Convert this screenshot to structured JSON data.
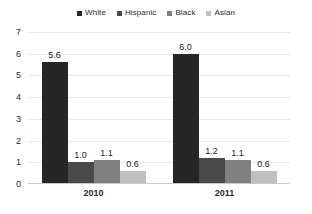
{
  "chart_data": {
    "type": "bar",
    "title": "",
    "subtitle": "",
    "xlabel": "",
    "ylabel": "",
    "categories": [
      "2010",
      "2011"
    ],
    "series": [
      {
        "name": "White",
        "color": "#262626",
        "values": [
          5.6,
          6.0
        ],
        "labels": [
          "5.6",
          "6.0"
        ]
      },
      {
        "name": "Hispanic",
        "color": "#4a4a4a",
        "values": [
          1.0,
          1.2
        ],
        "labels": [
          "1.0",
          "1.2"
        ]
      },
      {
        "name": "Black",
        "color": "#808080",
        "values": [
          1.1,
          1.1
        ],
        "labels": [
          "1.1",
          "1.1"
        ]
      },
      {
        "name": "Asian",
        "color": "#bfbfbf",
        "values": [
          0.6,
          0.6
        ],
        "labels": [
          "0.6",
          "0.6"
        ]
      }
    ],
    "ylim": [
      0,
      7
    ],
    "yticks": [
      0,
      1,
      2,
      3,
      4,
      5,
      6,
      7
    ],
    "ytick_labels": [
      "0",
      "1",
      "2",
      "3",
      "4",
      "5",
      "6",
      "7"
    ],
    "grid": true,
    "grid_axis": "y",
    "legend_position": "top",
    "data_labels": true
  },
  "colors": {
    "background": "#ffffff",
    "gridline": "#e8e8e8",
    "axis": "#c9c9c9",
    "text": "#2b2b2b"
  }
}
